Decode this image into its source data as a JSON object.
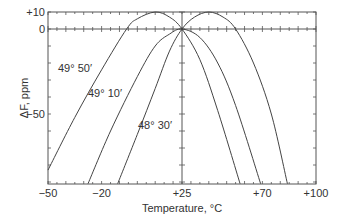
{
  "chart_data": {
    "type": "line",
    "title": "",
    "xlabel": "Temperature, °C",
    "ylabel": "ΔF, ppm",
    "xlim": [
      -50,
      100
    ],
    "ylim": [
      -91,
      10
    ],
    "x_tick_labels": [
      "−50",
      "−20",
      "+25",
      "+70",
      "+100"
    ],
    "x_tick_values": [
      -50,
      -20,
      25,
      70,
      100
    ],
    "y_tick_labels": [
      "+10",
      "0",
      "−50"
    ],
    "y_tick_values": [
      10,
      0,
      -50
    ],
    "grid": false,
    "legend": "none (inline curve labels)",
    "series": [
      {
        "name": "49° 50′",
        "label_pos": [
          58,
          72
        ],
        "points": [
          [
            -50,
            -83
          ],
          [
            -35,
            -52
          ],
          [
            -20,
            -24
          ],
          [
            -6,
            0
          ],
          [
            0,
            6
          ],
          [
            10,
            10
          ],
          [
            18,
            7
          ],
          [
            25,
            0
          ],
          [
            35,
            -18
          ],
          [
            45,
            -48
          ],
          [
            57.5,
            -91
          ]
        ]
      },
      {
        "name": "49° 10′",
        "label_pos": [
          88,
          97
        ],
        "points": [
          [
            -27.6,
            -91
          ],
          [
            -15,
            -60
          ],
          [
            0,
            -28
          ],
          [
            10,
            -10
          ],
          [
            18,
            -3
          ],
          [
            25,
            0
          ],
          [
            35,
            -5
          ],
          [
            45,
            -20
          ],
          [
            55,
            -45
          ],
          [
            69,
            -91
          ]
        ]
      },
      {
        "name": "48° 30′",
        "label_pos": [
          138,
          129
        ],
        "points": [
          [
            -11,
            -91
          ],
          [
            0,
            -62
          ],
          [
            10,
            -35
          ],
          [
            18,
            -13
          ],
          [
            25,
            0
          ],
          [
            32,
            7
          ],
          [
            40,
            10
          ],
          [
            48,
            7
          ],
          [
            55,
            0
          ],
          [
            65,
            -20
          ],
          [
            75,
            -50
          ],
          [
            84,
            -91
          ]
        ]
      }
    ]
  }
}
